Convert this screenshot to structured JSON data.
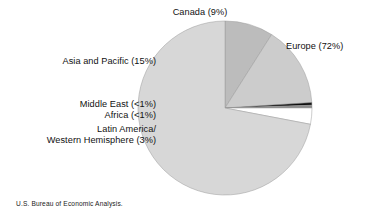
{
  "figure": {
    "source_note": "U.S. Bureau of Economic Analysis."
  },
  "labels": {
    "canada": "Canada (9%)",
    "europe": "Europe (72%)",
    "asia_pacific": "Asia and Pacific (15%)",
    "middle_east": "Middle East (<1%)",
    "africa": "Africa (<1%)",
    "latin_america_line1": "Latin America/",
    "latin_america_line2": "Western Hemisphere (3%)"
  },
  "chart_data": {
    "type": "pie",
    "title": "",
    "subtitle": "",
    "xlabel": "",
    "ylabel": "",
    "legend_position": "none",
    "grid": false,
    "annotations": [
      "U.S. Bureau of Economic Analysis."
    ],
    "start_angle_deg": 90,
    "direction": "counterclockwise",
    "center_px": [
      225,
      108
    ],
    "radius_px": 87,
    "categories": [
      "Canada",
      "Asia and Pacific",
      "Middle East",
      "Africa",
      "Latin America/Western Hemisphere",
      "Europe"
    ],
    "values": [
      9,
      15,
      0.5,
      0.5,
      3,
      72
    ],
    "value_labels": [
      "9%",
      "15%",
      "<1%",
      "<1%",
      "3%",
      "72%"
    ],
    "colors": [
      "#bcbcbc",
      "#cccccc",
      "#0d0d0d",
      "#8a8a8a",
      "#ffffff",
      "#d7d7d7"
    ],
    "slices": [
      {
        "name": "Canada",
        "value": 9,
        "label": "Canada (9%)",
        "color": "#bcbcbc"
      },
      {
        "name": "Asia and Pacific",
        "value": 15,
        "label": "Asia and Pacific (15%)",
        "color": "#cccccc"
      },
      {
        "name": "Middle East",
        "value": 0.5,
        "label": "Middle East (<1%)",
        "color": "#0d0d0d"
      },
      {
        "name": "Africa",
        "value": 0.5,
        "label": "Africa (<1%)",
        "color": "#8a8a8a"
      },
      {
        "name": "Latin America/Western Hemisphere",
        "value": 3,
        "label": "Western Hemisphere (3%)",
        "color": "#ffffff"
      },
      {
        "name": "Europe",
        "value": 72,
        "label": "Europe (72%)",
        "color": "#d7d7d7"
      }
    ]
  }
}
